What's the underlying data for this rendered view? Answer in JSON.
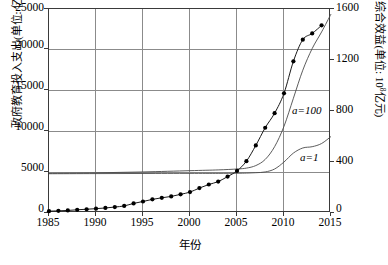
{
  "axes": {
    "x": {
      "title": "年份",
      "ticks": [
        "1985",
        "1990",
        "1995",
        "2000",
        "2005",
        "2010",
        "2015"
      ],
      "min": 1985,
      "max": 2015
    },
    "y_left": {
      "title": "政府教育投入支出(单位: 亿元)",
      "ticks": [
        "0",
        "5000",
        "10000",
        "15000",
        "20000",
        "25000"
      ],
      "min": 0,
      "max": 25000
    },
    "y_right": {
      "title_prefix": "综合效益(单位: 10",
      "title_exp": "8",
      "title_suffix": "亿元)",
      "ticks": [
        "0",
        "400",
        "800",
        "1200",
        "1600"
      ],
      "min": 0,
      "max": 1600
    }
  },
  "annotations": {
    "a100": "a=100",
    "a1": "a=1"
  },
  "colors": {
    "frame": "#3a3a3a",
    "grid": "#8b8b8b",
    "series_marker": "#000000",
    "series_line": "#4a4a4a"
  },
  "chart_data": {
    "type": "line",
    "title": "",
    "xlabel": "年份",
    "ylabel": "政府教育投入支出(单位: 亿元)",
    "y2label": "综合效益(单位: 10^8亿元)",
    "xlim": [
      1985,
      2015
    ],
    "ylim": [
      0,
      25000
    ],
    "y2lim": [
      0,
      1600
    ],
    "grid": true,
    "legend": "inline-annotations",
    "series": [
      {
        "name": "政府教育投入支出",
        "axis": "left",
        "style": "line-with-filled-circle-markers",
        "x": [
          1985,
          1986,
          1987,
          1988,
          1989,
          1990,
          1991,
          1992,
          1993,
          1994,
          1995,
          1996,
          1997,
          1998,
          1999,
          2000,
          2001,
          2002,
          2003,
          2004,
          2005,
          2006,
          2007,
          2008,
          2009,
          2010,
          2011,
          2012,
          2013,
          2014
        ],
        "values": [
          226,
          264,
          312,
          393,
          462,
          532,
          618,
          729,
          868,
          1175,
          1412,
          1672,
          1863,
          2032,
          2287,
          2563,
          3057,
          3491,
          3851,
          4466,
          5161,
          6348,
          8280,
          10450,
          12231,
          14670,
          18587,
          21242,
          22002,
          23000
        ]
      },
      {
        "name": "a=100",
        "axis": "right",
        "style": "smooth-line",
        "x": [
          1985,
          1990,
          1995,
          2000,
          2003,
          2005,
          2006,
          2007,
          2008,
          2009,
          2010,
          2011,
          2012,
          2013,
          2014,
          2015
        ],
        "values": [
          311,
          315,
          322,
          332,
          338,
          345,
          352,
          372,
          420,
          520,
          680,
          900,
          1120,
          1290,
          1420,
          1560
        ]
      },
      {
        "name": "a=1",
        "axis": "right",
        "style": "smooth-line",
        "x": [
          1985,
          1990,
          1995,
          2000,
          2003,
          2005,
          2006,
          2007,
          2008,
          2009,
          2010,
          2011,
          2012,
          2013,
          2014,
          2015
        ],
        "values": [
          308,
          309,
          310,
          311,
          311,
          312,
          313,
          316,
          322,
          345,
          400,
          470,
          510,
          520,
          545,
          600
        ]
      }
    ]
  }
}
